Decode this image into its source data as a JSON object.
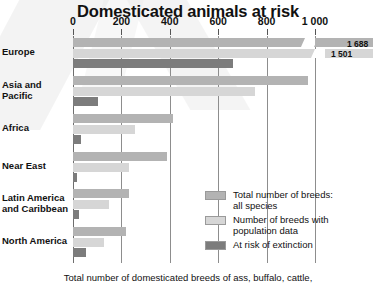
{
  "chart_data": {
    "type": "bar",
    "orientation": "horizontal",
    "title": "Domesticated animals at risk",
    "xlabel": "",
    "ylabel": "",
    "xlim": [
      0,
      1000
    ],
    "xticks": [
      0,
      200,
      400,
      600,
      800,
      1000
    ],
    "xtick_labels": [
      "0",
      "200",
      "400",
      "600",
      "800",
      "1 000"
    ],
    "grid": true,
    "legend_position": "inside-right",
    "categories": [
      "Europe",
      "Asia and Pacific",
      "Africa",
      "Near East",
      "Latin America and Caribbean",
      "North America"
    ],
    "series": [
      {
        "name": "Total number of breeds: all species",
        "color": "#b3b3b3",
        "values": [
          1688,
          970,
          415,
          390,
          230,
          220
        ]
      },
      {
        "name": "Number of breeds with population data",
        "color": "#d6d6d6",
        "values": [
          1501,
          750,
          255,
          230,
          150,
          130
        ]
      },
      {
        "name": "At risk of extinction",
        "color": "#7c7c7c",
        "values": [
          660,
          105,
          35,
          15,
          25,
          55
        ]
      }
    ],
    "annotations": [
      {
        "text": "1 688",
        "series": "Total number of breeds: all species",
        "category": "Europe"
      },
      {
        "text": "1 501",
        "series": "Number of breeds with population data",
        "category": "Europe"
      }
    ],
    "axis_break": {
      "category": "Europe",
      "note": "Europe bars exceed axis maximum and are drawn broken with value labels"
    },
    "footnote": "Total number of domesticated breeds of ass, buffalo, cattle,"
  },
  "legend": {
    "items": [
      {
        "label_line1": "Total number of breeds:",
        "label_line2": "all species",
        "color": "#b3b3b3",
        "swatch_name": "legend-swatch-total"
      },
      {
        "label_line1": "Number of breeds with",
        "label_line2": "population data",
        "color": "#d6d6d6",
        "swatch_name": "legend-swatch-with-data"
      },
      {
        "label_line1": "At risk of extinction",
        "label_line2": "",
        "color": "#7c7c7c",
        "swatch_name": "legend-swatch-at-risk"
      }
    ]
  },
  "regions": [
    {
      "label_line1": "Europe",
      "label_line2": ""
    },
    {
      "label_line1": "Asia and",
      "label_line2": "Pacific"
    },
    {
      "label_line1": "Africa",
      "label_line2": ""
    },
    {
      "label_line1": "Near East",
      "label_line2": ""
    },
    {
      "label_line1": "Latin America",
      "label_line2": "and Caribbean"
    },
    {
      "label_line1": "North America",
      "label_line2": ""
    }
  ]
}
